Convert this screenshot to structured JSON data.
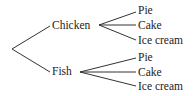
{
  "diagram": {
    "type": "tree",
    "root": "",
    "branches": [
      {
        "label": "Chicken",
        "children": [
          "Pie",
          "Cake",
          "Ice cream"
        ]
      },
      {
        "label": "Fish",
        "children": [
          "Pie",
          "Cake",
          "Ice cream"
        ]
      }
    ],
    "line_color": "#333333",
    "text_color": "#222222"
  }
}
